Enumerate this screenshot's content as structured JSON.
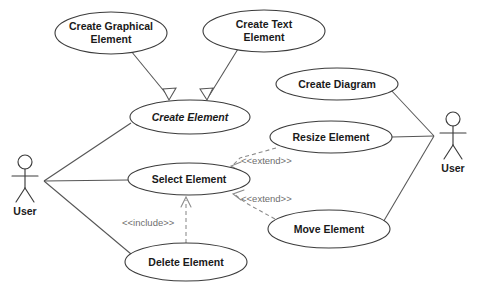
{
  "diagram": {
    "type": "uml-use-case-diagram",
    "background_color": "#ffffff",
    "stroke_color": "#3c3c3c",
    "line_color": "#555555",
    "dashed_color": "#8a8a8a",
    "text_color": "#1a1a1a",
    "stereotype_color": "#6e6e6e",
    "actors": [
      {
        "id": "actor-left",
        "label": "User",
        "cx": 25,
        "cy": 180
      },
      {
        "id": "actor-right",
        "label": "User",
        "cx": 453,
        "cy": 135
      }
    ],
    "use_cases": [
      {
        "id": "create-graphical-element",
        "label": "Create Graphical Element",
        "line1": "Create Graphical",
        "line2": "Element",
        "cx": 111,
        "cy": 33,
        "rx": 56,
        "ry": 21,
        "italic": false
      },
      {
        "id": "create-text-element",
        "label": "Create Text Element",
        "line1": "Create Text",
        "line2": "Element",
        "cx": 264,
        "cy": 31,
        "rx": 61,
        "ry": 21,
        "italic": false
      },
      {
        "id": "create-element",
        "label": "Create Element",
        "line1": "Create Element",
        "line2": "",
        "cx": 190,
        "cy": 117,
        "rx": 60,
        "ry": 17,
        "italic": true
      },
      {
        "id": "create-diagram",
        "label": "Create Diagram",
        "line1": "Create Diagram",
        "line2": "",
        "cx": 337,
        "cy": 84,
        "rx": 61,
        "ry": 16,
        "italic": false
      },
      {
        "id": "resize-element",
        "label": "Resize Element",
        "line1": "Resize Element",
        "line2": "",
        "cx": 331,
        "cy": 137,
        "rx": 61,
        "ry": 16,
        "italic": false
      },
      {
        "id": "select-element",
        "label": "Select Element",
        "line1": "Select Element",
        "line2": "",
        "cx": 189,
        "cy": 179,
        "rx": 61,
        "ry": 16,
        "italic": false
      },
      {
        "id": "move-element",
        "label": "Move Element",
        "line1": "Move Element",
        "line2": "",
        "cx": 329,
        "cy": 229,
        "rx": 61,
        "ry": 19,
        "italic": false
      },
      {
        "id": "delete-element",
        "label": "Delete Element",
        "line1": "Delete Element",
        "line2": "",
        "cx": 186,
        "cy": 262,
        "rx": 61,
        "ry": 19,
        "italic": false
      }
    ],
    "stereotypes": [
      {
        "id": "extend-resize",
        "label": "<<extend>>",
        "x": 241,
        "y": 161
      },
      {
        "id": "extend-move",
        "label": "<<extend>>",
        "x": 241,
        "y": 199
      },
      {
        "id": "include-delete",
        "label": "<<include>>",
        "x": 122,
        "y": 223
      }
    ],
    "relationships": [
      {
        "id": "gen-graphical-to-create",
        "kind": "generalization",
        "from": "create-graphical-element",
        "to": "create-element"
      },
      {
        "id": "gen-text-to-create",
        "kind": "generalization",
        "from": "create-text-element",
        "to": "create-element"
      },
      {
        "id": "assoc-user-left-create",
        "kind": "association",
        "from": "actor-left",
        "to": "create-element"
      },
      {
        "id": "assoc-user-left-select",
        "kind": "association",
        "from": "actor-left",
        "to": "select-element"
      },
      {
        "id": "assoc-user-left-delete",
        "kind": "association",
        "from": "actor-left",
        "to": "delete-element"
      },
      {
        "id": "assoc-user-right-diagram",
        "kind": "association",
        "from": "actor-right",
        "to": "create-diagram"
      },
      {
        "id": "assoc-user-right-resize",
        "kind": "association",
        "from": "actor-right",
        "to": "resize-element"
      },
      {
        "id": "assoc-user-right-move",
        "kind": "association",
        "from": "actor-right",
        "to": "move-element"
      },
      {
        "id": "extend-resize-select",
        "kind": "extend",
        "from": "resize-element",
        "to": "select-element"
      },
      {
        "id": "extend-move-select",
        "kind": "extend",
        "from": "move-element",
        "to": "select-element"
      },
      {
        "id": "include-delete-select",
        "kind": "include",
        "from": "delete-element",
        "to": "select-element"
      }
    ]
  }
}
